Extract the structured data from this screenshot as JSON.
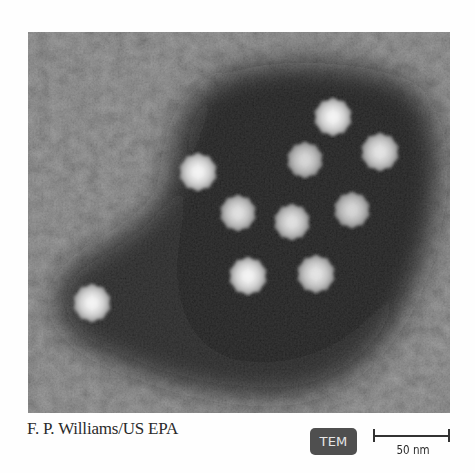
{
  "figure": {
    "type": "transmission electron micrograph",
    "particle_count": 10,
    "particles": [
      {
        "id": 1,
        "cx": 333,
        "cy": 117,
        "r": 21
      },
      {
        "id": 2,
        "cx": 305,
        "cy": 160,
        "r": 20
      },
      {
        "id": 3,
        "cx": 380,
        "cy": 152,
        "r": 21
      },
      {
        "id": 4,
        "cx": 198,
        "cy": 172,
        "r": 21
      },
      {
        "id": 5,
        "cx": 238,
        "cy": 213,
        "r": 20
      },
      {
        "id": 6,
        "cx": 292,
        "cy": 222,
        "r": 20
      },
      {
        "id": 7,
        "cx": 352,
        "cy": 210,
        "r": 20
      },
      {
        "id": 8,
        "cx": 248,
        "cy": 276,
        "r": 21
      },
      {
        "id": 9,
        "cx": 316,
        "cy": 274,
        "r": 21
      },
      {
        "id": 10,
        "cx": 92,
        "cy": 303,
        "r": 21
      }
    ],
    "colors": {
      "background_gray": "#5a5a5a",
      "dark_region": "#151515",
      "particle": "#e8e8e8"
    }
  },
  "caption": {
    "credit": "F. P. Williams/US EPA"
  },
  "badge": {
    "label": "TEM",
    "color": "#4f4f4f"
  },
  "scale_bar": {
    "label": "50 nm"
  }
}
